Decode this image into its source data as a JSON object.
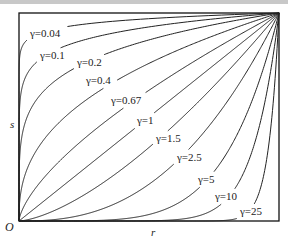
{
  "chart_data": {
    "type": "line",
    "title": "",
    "xlabel": "r",
    "ylabel": "s",
    "origin_label": "O",
    "function": "s = r^gamma",
    "xlim": [
      0,
      1
    ],
    "ylim": [
      0,
      1
    ],
    "grid": false,
    "series": [
      {
        "name": "γ=0.04",
        "gamma": 0.04,
        "label_pos": [
          30,
          28
        ]
      },
      {
        "name": "γ=0.1",
        "gamma": 0.1,
        "label_pos": [
          40,
          50
        ]
      },
      {
        "name": "γ=0.2",
        "gamma": 0.2,
        "label_pos": [
          77,
          57
        ]
      },
      {
        "name": "γ=0.4",
        "gamma": 0.4,
        "label_pos": [
          86,
          75
        ]
      },
      {
        "name": "γ=0.67",
        "gamma": 0.67,
        "label_pos": [
          111,
          95
        ]
      },
      {
        "name": "γ=1",
        "gamma": 1,
        "label_pos": [
          137,
          115
        ]
      },
      {
        "name": "γ=1.5",
        "gamma": 1.5,
        "label_pos": [
          156,
          133
        ]
      },
      {
        "name": "γ=2.5",
        "gamma": 2.5,
        "label_pos": [
          177,
          152
        ]
      },
      {
        "name": "γ=5",
        "gamma": 5,
        "label_pos": [
          198,
          174
        ]
      },
      {
        "name": "γ=10",
        "gamma": 10,
        "label_pos": [
          215,
          191
        ]
      },
      {
        "name": "γ=25",
        "gamma": 25,
        "label_pos": [
          240,
          206
        ]
      }
    ]
  },
  "frame": {
    "left": 19,
    "top": 13,
    "right": 279,
    "bottom": 221
  },
  "colors": {
    "line": "#222222",
    "frame": "#111111",
    "top_strip": "#c8c8c8"
  }
}
